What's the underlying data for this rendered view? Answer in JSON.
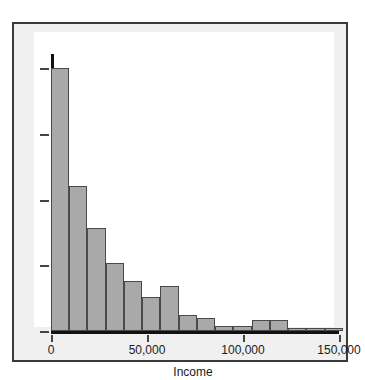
{
  "figure": {
    "top_caption": "",
    "background_color": "#f0f0f0",
    "frame_color": "#3a3a3a",
    "plot_background": "#ffffff"
  },
  "axes": {
    "x_title": "Income",
    "x_tick_labels": [
      "0",
      "50,000",
      "100,000",
      "150,000"
    ],
    "y_tick_count": 5,
    "y_tick_labels": [
      "",
      "",
      "",
      "",
      ""
    ]
  },
  "chart_data": {
    "type": "bar",
    "title": "",
    "subtitle": "",
    "xlabel": "Income",
    "ylabel": "",
    "grid": false,
    "legend": null,
    "xlim": [
      0,
      150000
    ],
    "ylim": [
      0,
      1
    ],
    "bin_width": 9500,
    "note": "Right-skewed income histogram; bar heights read as fraction of the tallest bar (first bin = 1.00).",
    "categories": [
      "0-9,500",
      "9,500-19,000",
      "19,000-28,500",
      "28,500-38,000",
      "38,000-47,500",
      "47,500-57,000",
      "57,000-66,500",
      "66,500-76,000",
      "76,000-85,500",
      "85,500-95,000",
      "95,000-104,500",
      "104,500-114,000",
      "114,000-123,500",
      "123,500-133,000",
      "133,000-142,500",
      "142,500-152,000"
    ],
    "x": [
      4750,
      14250,
      23750,
      33250,
      42750,
      52250,
      61750,
      71250,
      80750,
      90250,
      99750,
      109250,
      118750,
      128250,
      137750,
      147250
    ],
    "values": [
      1.0,
      0.55,
      0.39,
      0.26,
      0.19,
      0.13,
      0.17,
      0.06,
      0.05,
      0.02,
      0.02,
      0.04,
      0.04,
      0.01,
      0.01,
      0.01
    ],
    "bar_fill_color": "#a9a9a9",
    "bar_edge_color": "#4a4a4a"
  }
}
